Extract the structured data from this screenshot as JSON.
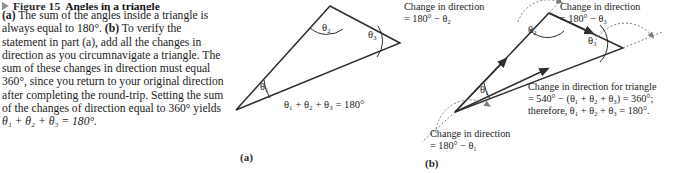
{
  "figure": {
    "bullet_icon": "triangle-right-icon",
    "number_label": "Figure 15",
    "title": "Angles in a triangle",
    "caption_parts": {
      "a_tag": "(a)",
      "a_text_1": " The sum of the angles inside a triangle is always equal to 180°. ",
      "b_tag": "(b)",
      "b_text_1": " To verify the statement in part (a), add all the changes in direction as you circumnavigate a triangle. The sum of these changes in direction must equal 360°, since you return to your original direction after completing the round-trip. Setting the sum of the changes of direction equal to 360° yields ",
      "final_equation": "θ₁ + θ₂ + θ₃ = 180°."
    }
  },
  "panel_a": {
    "tag": "(a)",
    "angle_labels": [
      "θ₁",
      "θ₂",
      "θ₃"
    ],
    "equation": "θ₁ + θ₂ + θ₃ = 180°"
  },
  "panel_b": {
    "tag": "(b)",
    "angle_labels": [
      "θ₁",
      "θ₂",
      "θ₃"
    ],
    "note_theta2": {
      "line1": "Change in direction",
      "line2": "= 180° − θ₂"
    },
    "note_theta3": {
      "line1": "Change in direction",
      "line2": "= 180° − θ₃"
    },
    "note_theta1": {
      "line1": "Change in direction",
      "line2": "= 180° − θ₁"
    },
    "note_total": {
      "line1": "Change in direction for triangle",
      "line2": "= 540° − (θ₁ + θ₂ + θ₃) = 360°;",
      "line3": "therefore, θ₁ + θ₂ + θ₃ = 180°."
    }
  },
  "style": {
    "line_color": "#2e2e2e",
    "dotted_color": "#7c7c7c",
    "background": "#ffffff"
  }
}
